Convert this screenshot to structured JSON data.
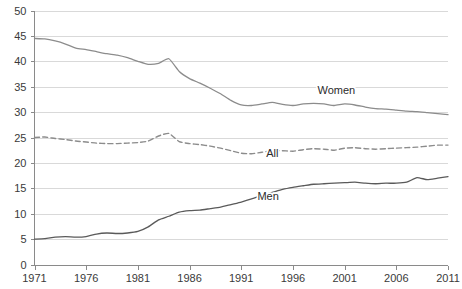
{
  "chart_data": {
    "type": "line",
    "title": "",
    "subtitle": "",
    "xlabel": "",
    "ylabel": "",
    "xlim": [
      1971,
      2011
    ],
    "ylim": [
      0,
      50
    ],
    "grid": true,
    "legend_position": "inline-labels",
    "y_ticks": [
      0,
      5,
      10,
      15,
      20,
      25,
      30,
      35,
      40,
      45,
      50
    ],
    "y_tick_labels": [
      "0",
      "5",
      "10",
      "15",
      "20",
      "25",
      "30",
      "35",
      "40",
      "45",
      "50"
    ],
    "x_ticks": [
      1971,
      1976,
      1981,
      1986,
      1991,
      1996,
      2001,
      2006,
      2011
    ],
    "x_tick_labels": [
      "1971",
      "1976",
      "1981",
      "1986",
      "1991",
      "1996",
      "2001",
      "2006",
      "2011"
    ],
    "x": [
      1971,
      1972,
      1973,
      1974,
      1975,
      1976,
      1977,
      1978,
      1979,
      1980,
      1981,
      1982,
      1983,
      1984,
      1985,
      1986,
      1987,
      1988,
      1989,
      1990,
      1991,
      1992,
      1993,
      1994,
      1995,
      1996,
      1997,
      1998,
      1999,
      2000,
      2001,
      2002,
      2003,
      2004,
      2005,
      2006,
      2007,
      2008,
      2009,
      2010,
      2011
    ],
    "series": [
      {
        "name": "Women",
        "label": "Women",
        "color": "#8c8c8c",
        "style": "solid",
        "label_x": 2000.2,
        "label_y": 33.6,
        "values": [
          44.5,
          44.4,
          44.0,
          43.4,
          42.6,
          42.3,
          41.9,
          41.5,
          41.2,
          40.7,
          40.0,
          39.4,
          39.6,
          40.5,
          38.0,
          36.6,
          35.7,
          34.7,
          33.6,
          32.3,
          31.4,
          31.3,
          31.6,
          31.9,
          31.5,
          31.3,
          31.6,
          31.7,
          31.6,
          31.3,
          31.6,
          31.4,
          31.0,
          30.7,
          30.6,
          30.4,
          30.2,
          30.1,
          29.9,
          29.7,
          29.5
        ]
      },
      {
        "name": "All",
        "label": "All",
        "color": "#8c8c8c",
        "style": "dashed",
        "label_x": 1994.0,
        "label_y": 21.1,
        "values": [
          25.0,
          25.1,
          24.8,
          24.6,
          24.3,
          24.1,
          23.9,
          23.8,
          23.8,
          23.9,
          24.0,
          24.3,
          25.3,
          25.8,
          24.2,
          23.8,
          23.6,
          23.3,
          22.9,
          22.4,
          21.9,
          21.8,
          22.1,
          22.4,
          22.4,
          22.3,
          22.6,
          22.8,
          22.7,
          22.5,
          22.9,
          23.0,
          22.8,
          22.7,
          22.8,
          22.9,
          23.0,
          23.1,
          23.3,
          23.5,
          23.5
        ]
      },
      {
        "name": "Men",
        "label": "Men",
        "color": "#5a5a5a",
        "style": "solid",
        "label_x": 1993.6,
        "label_y": 12.7,
        "values": [
          5.0,
          5.1,
          5.4,
          5.5,
          5.4,
          5.5,
          6.0,
          6.2,
          6.1,
          6.2,
          6.5,
          7.4,
          8.8,
          9.5,
          10.3,
          10.6,
          10.7,
          11.0,
          11.3,
          11.8,
          12.3,
          12.9,
          13.6,
          14.2,
          14.8,
          15.2,
          15.5,
          15.8,
          15.9,
          16.0,
          16.1,
          16.2,
          16.0,
          15.9,
          16.0,
          16.0,
          16.2,
          17.1,
          16.7,
          17.0,
          17.3
        ]
      }
    ]
  }
}
